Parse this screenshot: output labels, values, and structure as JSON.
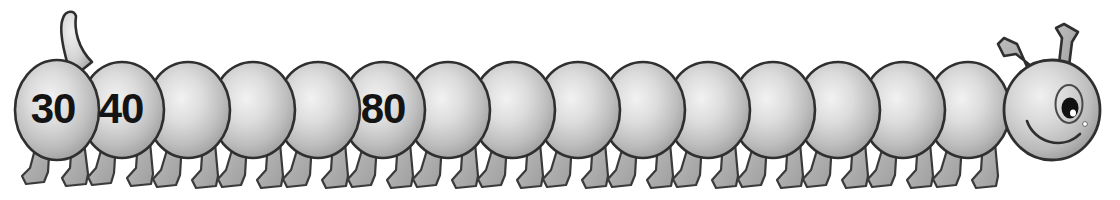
{
  "worksheet": {
    "illustration_name": "counting-caterpillar",
    "theme": "skip-counting-by-tens",
    "background_color": "#ffffff",
    "outline_color": "#2b2b2b",
    "body_light": "#eeeeee",
    "body_mid": "#c9c9c9",
    "body_dark": "#9a9a9a",
    "leg_color": "#a8a8a8",
    "text_color": "#141414"
  },
  "caterpillar": {
    "segment_count": 16,
    "head": {
      "name": "head",
      "eye": {
        "pupil_color": "#111111",
        "highlight_color": "#ffffff"
      },
      "antennae_count": 2,
      "mouth": "smile"
    },
    "tail": {
      "name": "tail-horn",
      "direction": "up-left"
    },
    "segments": [
      {
        "index": 1,
        "label": "30",
        "filled": true,
        "cx": 53,
        "cy": 108
      },
      {
        "index": 2,
        "label": "40",
        "filled": true,
        "cx": 120,
        "cy": 108
      },
      {
        "index": 3,
        "label": "",
        "filled": false,
        "cx": 185,
        "cy": 110
      },
      {
        "index": 4,
        "label": "",
        "filled": false,
        "cx": 250,
        "cy": 110
      },
      {
        "index": 5,
        "label": "",
        "filled": false,
        "cx": 315,
        "cy": 110
      },
      {
        "index": 6,
        "label": "80",
        "filled": true,
        "cx": 383,
        "cy": 108
      },
      {
        "index": 7,
        "label": "",
        "filled": false,
        "cx": 448,
        "cy": 110
      },
      {
        "index": 8,
        "label": "",
        "filled": false,
        "cx": 513,
        "cy": 110
      },
      {
        "index": 9,
        "label": "",
        "filled": false,
        "cx": 578,
        "cy": 110
      },
      {
        "index": 10,
        "label": "",
        "filled": false,
        "cx": 643,
        "cy": 110
      },
      {
        "index": 11,
        "label": "",
        "filled": false,
        "cx": 708,
        "cy": 110
      },
      {
        "index": 12,
        "label": "",
        "filled": false,
        "cx": 773,
        "cy": 110
      },
      {
        "index": 13,
        "label": "",
        "filled": false,
        "cx": 838,
        "cy": 110
      },
      {
        "index": 14,
        "label": "",
        "filled": false,
        "cx": 903,
        "cy": 110
      },
      {
        "index": 15,
        "label": "",
        "filled": false,
        "cx": 968,
        "cy": 110
      },
      {
        "index": 16,
        "label": "",
        "filled": false,
        "cx": 1020,
        "cy": 110
      }
    ],
    "visible_numbers": [
      "30",
      "40",
      "80"
    ]
  }
}
